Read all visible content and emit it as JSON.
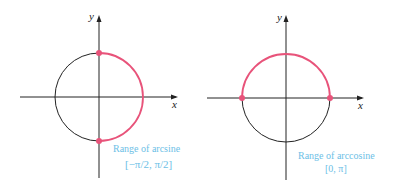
{
  "colors": {
    "highlight": "#e8537a",
    "axis": "#222222",
    "label": "#6cc0e6"
  },
  "left_diagram": {
    "x_label": "x",
    "y_label": "y",
    "caption_line1": "Range of arcsine",
    "caption_line2": "[−π/2, π/2]",
    "highlighted_arc": "right semicircle",
    "points": [
      "(0, 1)",
      "(0, −1)"
    ]
  },
  "right_diagram": {
    "x_label": "x",
    "y_label": "y",
    "caption_line1": "Range of arccosine",
    "caption_line2": "[0, π]",
    "highlighted_arc": "upper semicircle",
    "points": [
      "(−1, 0)",
      "(1, 0)"
    ]
  }
}
